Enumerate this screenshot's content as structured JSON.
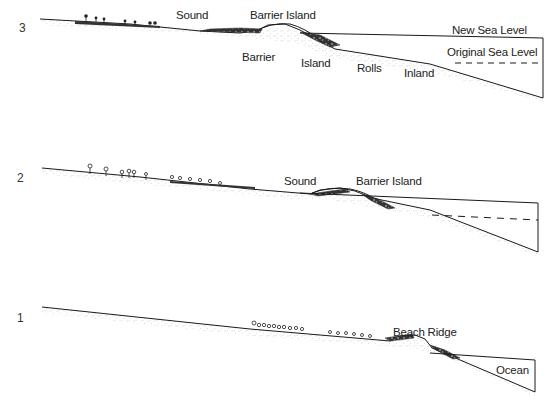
{
  "diagram": {
    "type": "cross-section",
    "stages": [
      {
        "number": "1",
        "labels": {
          "beach_ridge": "Beach Ridge",
          "ocean": "Ocean"
        }
      },
      {
        "number": "2",
        "labels": {
          "sound": "Sound",
          "barrier_island": "Barrier Island"
        }
      },
      {
        "number": "3",
        "labels": {
          "sound": "Sound",
          "barrier_island": "Barrier Island",
          "new_sea_level": "New Sea Level",
          "original_sea_level": "Original Sea Level",
          "caption_words": [
            "Barrier",
            "Island",
            "Rolls",
            "Inland"
          ]
        }
      }
    ],
    "colors": {
      "ink": "#1a1a1a",
      "stipple": "#777777",
      "background": "#ffffff"
    }
  }
}
